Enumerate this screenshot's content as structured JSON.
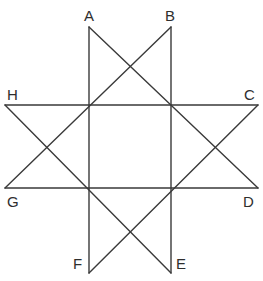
{
  "figure": {
    "type": "geometric-line-diagram",
    "canvas": {
      "width": 263,
      "height": 281
    },
    "stroke_color": "#3a3a3a",
    "label_color": "#2e2e2e",
    "background_color": "#ffffff",
    "stroke_width": 1.4
  },
  "vertices": [
    {
      "id": "A",
      "label": "A",
      "x": 89,
      "y": 27,
      "label_x": 84,
      "label_y": 8
    },
    {
      "id": "B",
      "label": "B",
      "x": 171,
      "y": 27,
      "label_x": 165,
      "label_y": 8
    },
    {
      "id": "C",
      "label": "C",
      "x": 258,
      "y": 105,
      "label_x": 244,
      "label_y": 87
    },
    {
      "id": "D",
      "label": "D",
      "x": 258,
      "y": 188,
      "label_x": 243,
      "label_y": 194
    },
    {
      "id": "E",
      "label": "E",
      "x": 171,
      "y": 273,
      "label_x": 176,
      "label_y": 256
    },
    {
      "id": "F",
      "label": "F",
      "x": 89,
      "y": 273,
      "label_x": 73,
      "label_y": 256
    },
    {
      "id": "G",
      "label": "G",
      "x": 5,
      "y": 188,
      "label_x": 7,
      "label_y": 194
    },
    {
      "id": "H",
      "label": "H",
      "x": 5,
      "y": 105,
      "label_x": 7,
      "label_y": 87
    }
  ],
  "edges": [
    {
      "id": "edge-A-F",
      "from": "A",
      "to": "F",
      "x1": 89,
      "y1": 27,
      "x2": 89,
      "y2": 273
    },
    {
      "id": "edge-B-E",
      "from": "B",
      "to": "E",
      "x1": 171,
      "y1": 27,
      "x2": 171,
      "y2": 273
    },
    {
      "id": "edge-H-C",
      "from": "H",
      "to": "C",
      "x1": 5,
      "y1": 105,
      "x2": 258,
      "y2": 105
    },
    {
      "id": "edge-G-D",
      "from": "G",
      "to": "D",
      "x1": 5,
      "y1": 188,
      "x2": 258,
      "y2": 188
    },
    {
      "id": "edge-A-D",
      "from": "A",
      "to": "D",
      "x1": 89,
      "y1": 27,
      "x2": 258,
      "y2": 188
    },
    {
      "id": "edge-B-G",
      "from": "B",
      "to": "G",
      "x1": 171,
      "y1": 27,
      "x2": 5,
      "y2": 188
    },
    {
      "id": "edge-H-E",
      "from": "H",
      "to": "E",
      "x1": 5,
      "y1": 105,
      "x2": 171,
      "y2": 273
    },
    {
      "id": "edge-C-F",
      "from": "C",
      "to": "F",
      "x1": 258,
      "y1": 105,
      "x2": 89,
      "y2": 273
    }
  ],
  "inner_square": {
    "corners": [
      {
        "x": 89,
        "y": 105
      },
      {
        "x": 171,
        "y": 105
      },
      {
        "x": 171,
        "y": 188
      },
      {
        "x": 89,
        "y": 188
      }
    ]
  }
}
